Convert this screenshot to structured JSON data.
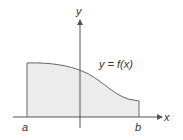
{
  "diagram": {
    "axes": {
      "x_label": "x",
      "y_label": "y"
    },
    "curve_label": "y = f(x)",
    "bounds": {
      "left": "a",
      "right": "b"
    },
    "colors": {
      "fill": "#ececec",
      "stroke": "#555555",
      "axis": "#555555"
    }
  }
}
